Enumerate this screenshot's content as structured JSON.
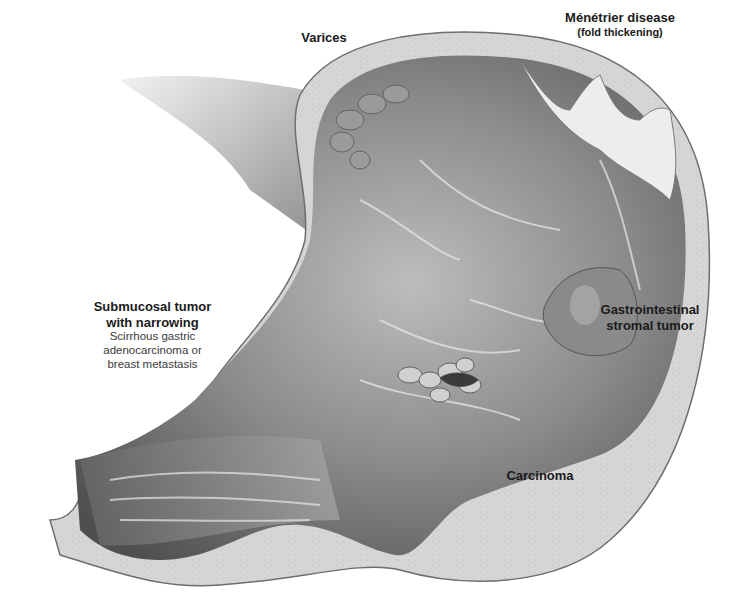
{
  "figure": {
    "colors": {
      "wall_outer": "#d9d9d9",
      "wall_line": "#6e6e6e",
      "mucosa_dark": "#4a4a4a",
      "mucosa_mid": "#8c8c8c",
      "mucosa_light": "#e6e6e6",
      "submucosa": "#cfcfcf",
      "tumor": "#8a8a8a"
    }
  },
  "labels": {
    "varices": {
      "title": "Varices"
    },
    "menetrier": {
      "title": "Ménétrier disease",
      "subtitle": "(fold thickening)"
    },
    "submucosal": {
      "title_line1": "Submucosal tumor",
      "title_line2": "with narrowing",
      "desc_line1": "Scirrhous gastric",
      "desc_line2": "adenocarcinoma or",
      "desc_line3": "breast metastasis"
    },
    "gist": {
      "title_line1": "Gastrointestinal",
      "title_line2": "stromal tumor"
    },
    "carcinoma": {
      "title": "Carcinoma"
    }
  }
}
